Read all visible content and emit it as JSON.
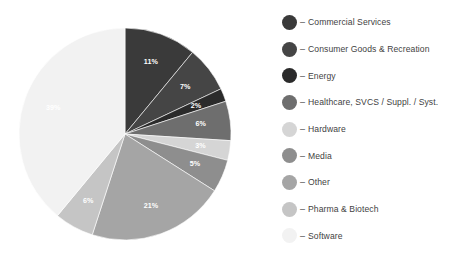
{
  "chart_data": {
    "type": "pie",
    "title": "",
    "subtitle": "",
    "xlabel": "",
    "ylabel": "",
    "legend_position": "right",
    "grid": false,
    "start_angle_deg": 0,
    "direction": "clockwise",
    "value_unit": "%",
    "categories": [
      "Commercial Services",
      "Consumer Goods & Recreation",
      "Energy",
      "Healthcare, SVCS / Suppl. / Syst.",
      "Hardware",
      "Media",
      "Other",
      "Pharma & Biotech",
      "Software"
    ],
    "values": [
      11,
      7,
      2,
      6,
      3,
      5,
      21,
      6,
      39
    ],
    "data_labels": [
      "11%",
      "7%",
      "2%",
      "6%",
      "3%",
      "5%",
      "21%",
      "6%",
      "39%"
    ],
    "colors": [
      "#3a3a3a",
      "#454545",
      "#2b2b2b",
      "#6e6e6e",
      "#d5d5d5",
      "#8e8e8e",
      "#a5a5a5",
      "#c5c5c5",
      "#f2f2f2"
    ],
    "label_text_colors": [
      "#ffffff",
      "#ffffff",
      "#ffffff",
      "#ffffff",
      "#ffffff",
      "#ffffff",
      "#ffffff",
      "#ffffff",
      "#4a4a4a"
    ]
  },
  "legend": {
    "separator": "–",
    "items": [
      {
        "label": "Commercial Services",
        "color": "#3a3a3a"
      },
      {
        "label": "Consumer Goods & Recreation",
        "color": "#454545"
      },
      {
        "label": "Energy",
        "color": "#2b2b2b"
      },
      {
        "label": "Healthcare, SVCS / Suppl. / Syst.",
        "color": "#6e6e6e"
      },
      {
        "label": "Hardware",
        "color": "#d5d5d5"
      },
      {
        "label": "Media",
        "color": "#8e8e8e"
      },
      {
        "label": "Other",
        "color": "#a5a5a5"
      },
      {
        "label": "Pharma & Biotech",
        "color": "#c5c5c5"
      },
      {
        "label": "Software",
        "color": "#f2f2f2"
      }
    ]
  },
  "geometry": {
    "center_x": 125,
    "center_y": 134,
    "radius": 106,
    "label_radius_ratio": 0.72
  }
}
